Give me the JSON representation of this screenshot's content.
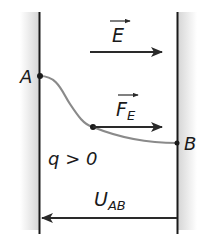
{
  "diagram": {
    "field_label": "E",
    "force_label_main": "F",
    "force_label_sub": "E",
    "point_a_label": "A",
    "point_b_label": "B",
    "charge_condition": "q > 0",
    "voltage_label_main": "U",
    "voltage_label_sub": "AB",
    "colors": {
      "plate": "#1a1a1a",
      "plate_shade": "#d8d8d8",
      "trajectory": "#8a8a8a",
      "arrow": "#2a2a2a",
      "background": "#ffffff"
    }
  }
}
